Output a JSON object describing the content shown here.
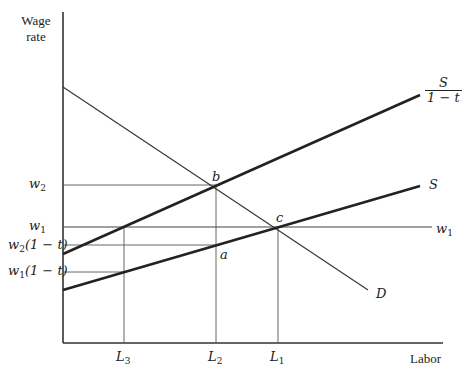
{
  "axes": {
    "y_title_line1": "Wage",
    "y_title_line2": "rate",
    "x_title": "Labor"
  },
  "y_ticks": [
    {
      "var": "w",
      "sub": "2",
      "suffix": ""
    },
    {
      "var": "w",
      "sub": "1",
      "suffix": ""
    },
    {
      "var": "w",
      "sub": "2",
      "suffix": "(1 − t)"
    },
    {
      "var": "w",
      "sub": "1",
      "suffix": "(1 − t)"
    }
  ],
  "x_ticks": [
    {
      "var": "L",
      "sub": "3"
    },
    {
      "var": "L",
      "sub": "2"
    },
    {
      "var": "L",
      "sub": "1"
    }
  ],
  "curves": {
    "supply_taxed_num": "S",
    "supply_taxed_den": "1 − t",
    "supply": "S",
    "demand": "D",
    "wage_line_var": "w",
    "wage_line_sub": "1"
  },
  "points": {
    "a": "a",
    "b": "b",
    "c": "c"
  },
  "colors": {
    "line": "#222222",
    "thin": "#444444",
    "background": "#ffffff"
  }
}
